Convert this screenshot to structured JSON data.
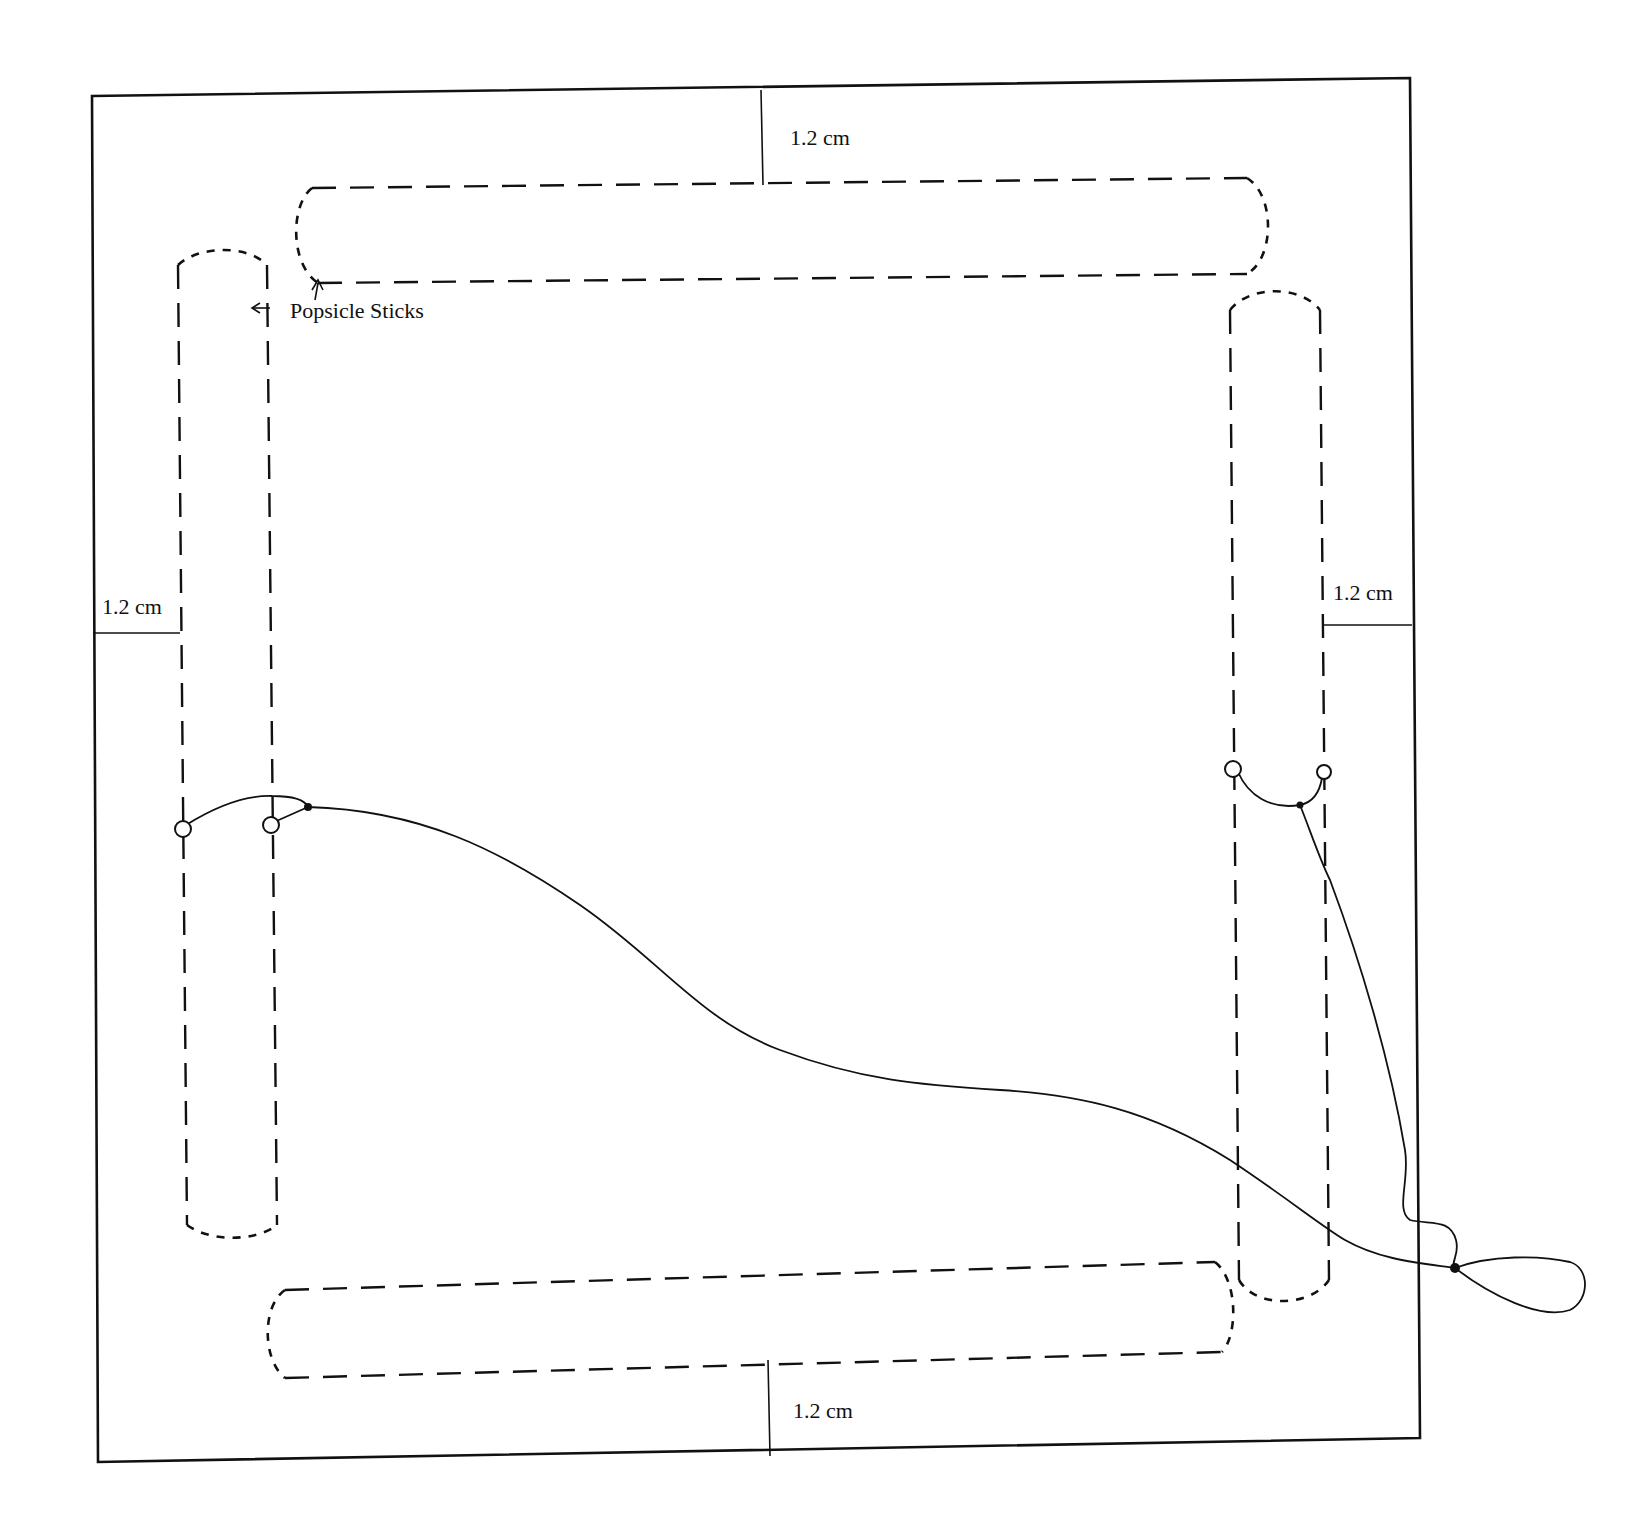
{
  "diagram": {
    "type": "construction-diagram",
    "colors": {
      "ink": "#111111",
      "paper": "#ffffff"
    },
    "labels": {
      "popsicle_sticks": "Popsicle Sticks",
      "margin_top": "1.2 cm",
      "margin_left": "1.2 cm",
      "margin_right": "1.2 cm",
      "margin_bottom": "1.2 cm"
    },
    "components": {
      "frame": "outer square board (solid line)",
      "sticks": [
        {
          "position": "top",
          "orientation": "horizontal",
          "style": "dashed outline"
        },
        {
          "position": "left",
          "orientation": "vertical",
          "style": "dashed outline"
        },
        {
          "position": "right",
          "orientation": "vertical",
          "style": "dashed outline"
        },
        {
          "position": "bottom",
          "orientation": "horizontal",
          "style": "dashed outline"
        }
      ],
      "dimensions": [
        {
          "side": "top",
          "value": "1.2 cm"
        },
        {
          "side": "left",
          "value": "1.2 cm"
        },
        {
          "side": "right",
          "value": "1.2 cm"
        },
        {
          "side": "bottom",
          "value": "1.2 cm"
        }
      ],
      "string": "attached to eyelets on left and right sticks, joined in a loop outside the frame at lower right"
    }
  }
}
